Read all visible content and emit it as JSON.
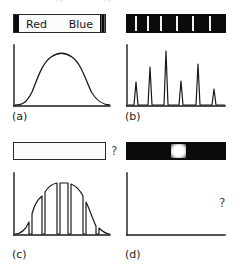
{
  "figure": {
    "top_remnant": {
      "left_text": "d",
      "right_text": "g"
    },
    "panels": [
      {
        "id": "a",
        "caption": "(a)",
        "band": {
          "type": "continuous",
          "style": "light",
          "labels": {
            "left": "Red",
            "right": "Blue"
          }
        },
        "plot": {
          "type": "line",
          "description": "smooth continuous blackbody-like hump",
          "xlabel": "",
          "ylabel": "",
          "has_question_mark": false
        }
      },
      {
        "id": "b",
        "caption": "(b)",
        "band": {
          "type": "emission",
          "style": "dark",
          "line_count": 6,
          "line_positions_pct": [
            8,
            20,
            34,
            50,
            66,
            84
          ]
        },
        "plot": {
          "type": "line",
          "description": "six narrow emission peaks on a flat baseline",
          "peak_positions_pct": [
            10,
            24,
            40,
            55,
            72,
            88
          ],
          "peak_heights_pct": [
            38,
            62,
            92,
            40,
            68,
            26
          ],
          "xlabel": "",
          "ylabel": "",
          "has_question_mark": false
        }
      },
      {
        "id": "c",
        "caption": "(c)",
        "band": {
          "type": "unknown-empty",
          "style": "light-empty",
          "labels": {
            "left": "",
            "right": ""
          }
        },
        "question_mark": "?",
        "plot": {
          "type": "line",
          "description": "continuous hump with six absorption dips cutting to baseline",
          "dip_positions_pct": [
            16,
            30,
            43,
            56,
            70,
            84
          ],
          "xlabel": "",
          "ylabel": "",
          "has_question_mark": false
        }
      },
      {
        "id": "d",
        "caption": "(d)",
        "band": {
          "type": "broad-emission",
          "style": "dark",
          "blob_center_pct": 52,
          "blob_width_pct": 15
        },
        "plot": {
          "type": "line",
          "description": "empty axes, spectrum unknown",
          "xlabel": "",
          "ylabel": "",
          "has_question_mark": true,
          "question_mark": "?"
        }
      }
    ],
    "colors": {
      "ink": "#1a1a1a",
      "band_dark": "#0b0b0b",
      "band_light": "#fbfbfb",
      "emission_line": "#f2f2f2"
    }
  }
}
